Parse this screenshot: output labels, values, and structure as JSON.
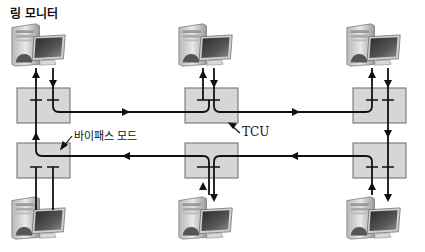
{
  "title_label": "링 모니터",
  "bypass_label": "바이패스 모드",
  "tcu_label": "TCU",
  "colors": {
    "box_fill": "#d6d6d6",
    "box_stroke": "#6a6a6a",
    "line": "#111111"
  },
  "stations": [
    {
      "id": "top-left",
      "role": "ring-monitor"
    },
    {
      "id": "top-middle"
    },
    {
      "id": "top-right"
    },
    {
      "id": "bottom-left",
      "mode": "bypass"
    },
    {
      "id": "bottom-middle"
    },
    {
      "id": "bottom-right"
    }
  ],
  "ring": {
    "top_direction": "left-to-right",
    "bottom_direction": "right-to-left"
  }
}
